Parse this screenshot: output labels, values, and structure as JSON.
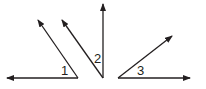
{
  "diagram": {
    "title": "",
    "stroke_color": "#231f20",
    "angles": [
      {
        "label": "1",
        "vertex": [
          78,
          78
        ],
        "rays": [
          [
            7,
            78
          ],
          [
            38,
            20
          ]
        ]
      },
      {
        "label": "2",
        "vertex": [
          103,
          78
        ],
        "rays": [
          [
            103,
            4
          ],
          [
            62,
            20
          ]
        ]
      },
      {
        "label": "3",
        "vertex": [
          118,
          78
        ],
        "rays": [
          [
            190,
            78
          ],
          [
            172,
            36
          ]
        ]
      }
    ]
  }
}
